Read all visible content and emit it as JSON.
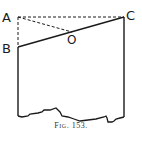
{
  "figure": {
    "caption": "Fig. 153.",
    "labels": {
      "A": "A",
      "B": "B",
      "C": "C",
      "O": "O"
    },
    "colors": {
      "ink": "#1a1a1a",
      "background": "#ffffff"
    }
  }
}
